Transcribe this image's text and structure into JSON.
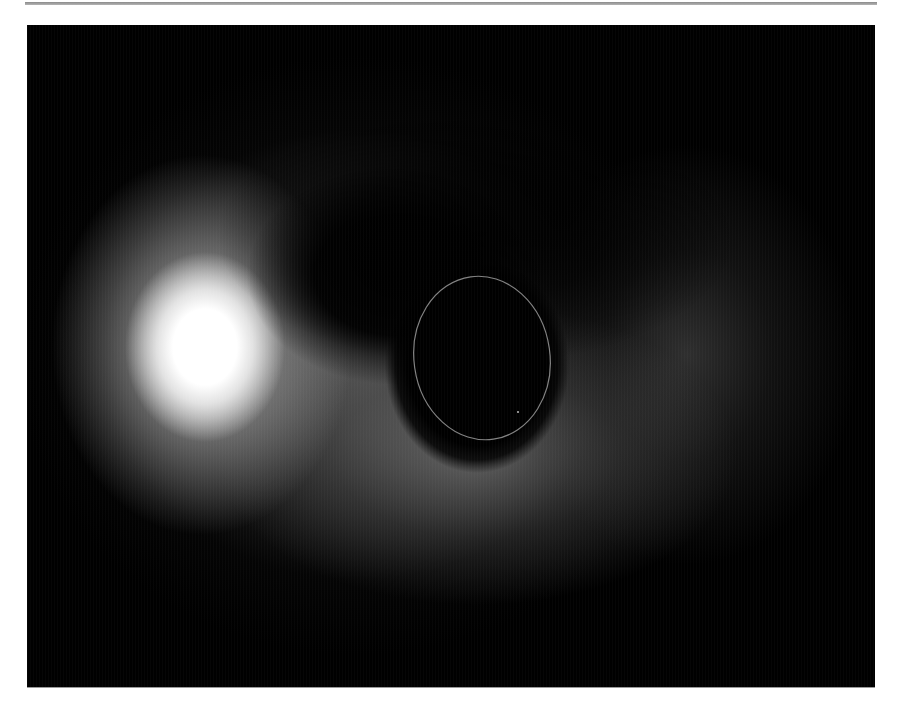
{
  "figure": {
    "colors": {
      "background": "#000000",
      "hotspot": "#ffffff",
      "ring": "#9a9a9a",
      "page": "#ffffff",
      "rule": "#8a8a8a"
    }
  }
}
